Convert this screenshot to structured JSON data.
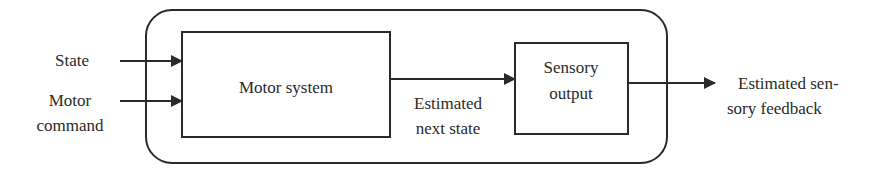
{
  "diagram": {
    "inputs": {
      "state": "State",
      "motor_line1": "Motor",
      "motor_line2": "command"
    },
    "blocks": {
      "motor_system": "Motor system",
      "sensory_output_line1": "Sensory",
      "sensory_output_line2": "output"
    },
    "edges": {
      "estimated_next_state_line1": "Estimated",
      "estimated_next_state_line2": "next state"
    },
    "output": {
      "line1": "Estimated sen-",
      "line2": "sory feedback"
    },
    "colors": {
      "stroke": "#2a2a2a",
      "background": "#ffffff"
    }
  }
}
